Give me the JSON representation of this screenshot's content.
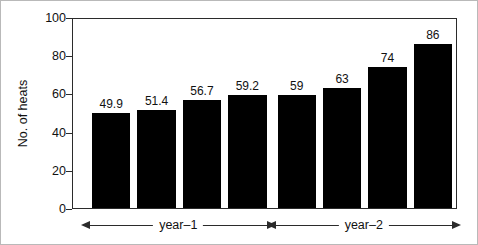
{
  "chart_data": {
    "type": "bar",
    "title": "",
    "xlabel": "",
    "ylabel": "No. of heats",
    "ylim": [
      0,
      100
    ],
    "yticks": [
      0,
      20,
      40,
      60,
      80,
      100
    ],
    "grid": false,
    "legend": null,
    "categories": [
      "1",
      "2",
      "3",
      "4",
      "5",
      "6",
      "7",
      "8"
    ],
    "values": [
      49.9,
      51.4,
      56.7,
      59.2,
      59,
      63,
      74,
      86
    ],
    "value_labels": [
      "49.9",
      "51.4",
      "56.7",
      "59.2",
      "59",
      "63",
      "74",
      "86"
    ],
    "bar_color": "#000000",
    "annotations": [
      {
        "label": "year–1",
        "span_start_index": 0,
        "span_end_index": 3,
        "style": "double-arrow"
      },
      {
        "label": "year–2",
        "span_start_index": 4,
        "span_end_index": 7,
        "style": "double-arrow"
      }
    ]
  },
  "axis": {
    "ylabel": "No. of heats",
    "tick_labels": [
      "100",
      "80",
      "60",
      "40",
      "20",
      "0"
    ]
  },
  "spans": [
    {
      "label": "year–1"
    },
    {
      "label": "year–2"
    }
  ]
}
